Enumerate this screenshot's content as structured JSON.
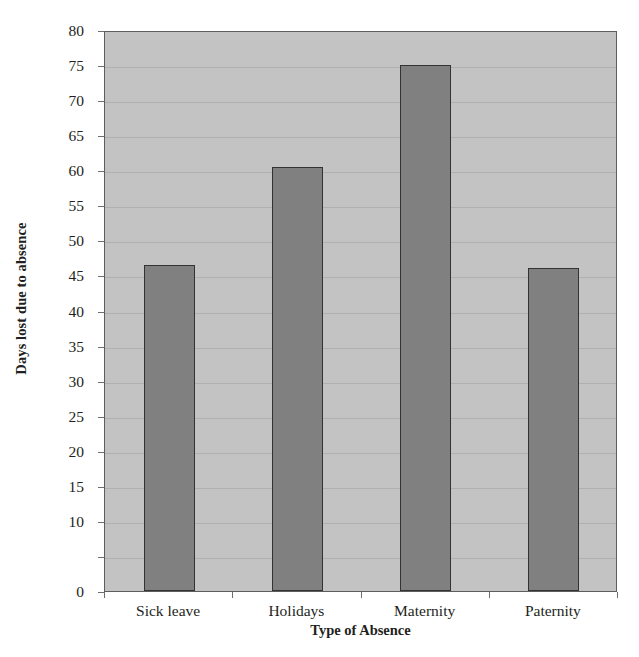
{
  "chart_data": {
    "type": "bar",
    "title": "",
    "xlabel": "Type of Absence",
    "ylabel": "Days lost due to absence",
    "categories": [
      "Sick leave",
      "Holidays",
      "Maternity",
      "Paternity"
    ],
    "values": [
      46.5,
      60.5,
      75,
      46
    ],
    "ylim": [
      0,
      80
    ],
    "ytick_values": [
      80,
      75,
      70,
      65,
      60,
      55,
      50,
      45,
      40,
      35,
      30,
      25,
      20,
      15,
      10,
      5,
      0
    ],
    "ytick_labels": [
      "80",
      "75",
      "70",
      "65",
      "60",
      "55",
      "50",
      "45",
      "40",
      "35",
      "30",
      "25",
      "20",
      "15",
      "10",
      "",
      "0"
    ],
    "grid": true,
    "legend": "none",
    "series": [
      {
        "name": "Days lost due to absence",
        "values": [
          46.5,
          60.5,
          75,
          46
        ]
      }
    ],
    "colors": {
      "bar_fill": "#808080",
      "bar_border": "#333333",
      "plot_background": "#c3c3c3",
      "gridline": "#b0b0b0",
      "axis": "#5d5d5d",
      "text": "#231f20",
      "figure_background": "#ffffff"
    }
  }
}
